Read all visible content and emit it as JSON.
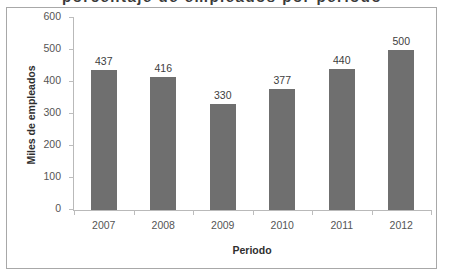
{
  "figure": {
    "clipped_heading": "porcentaje de empleados por periodo"
  },
  "chart_data": {
    "type": "bar",
    "title": "",
    "xlabel": "Periodo",
    "ylabel": "Miles de empleados",
    "categories": [
      "2007",
      "2008",
      "2009",
      "2010",
      "2011",
      "2012"
    ],
    "values": [
      437,
      416,
      330,
      377,
      440,
      500
    ],
    "value_labels": [
      "437",
      "416",
      "330",
      "377",
      "440",
      "500"
    ],
    "ylim": [
      0,
      600
    ],
    "yticks": [
      0,
      100,
      200,
      300,
      400,
      500,
      600
    ],
    "ytick_labels": [
      "0",
      "100",
      "200",
      "300",
      "400",
      "500",
      "600"
    ],
    "grid": false,
    "legend": false,
    "bar_color": "#6f6f6f",
    "axis_color": "#b9b9b9",
    "text_color": "#3d3d3d"
  }
}
